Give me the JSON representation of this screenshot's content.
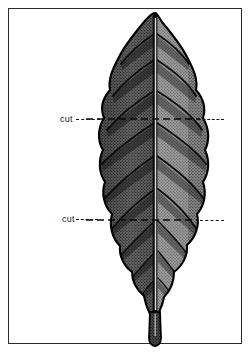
{
  "figure": {
    "style": "engraving",
    "frame": {
      "border_color": "#2b2b2b",
      "background": "#ffffff"
    }
  },
  "annotations": [
    {
      "id": "cut-upper",
      "label": "cut",
      "position": "upper",
      "leader": "dashed",
      "y": 119
    },
    {
      "id": "cut-lower",
      "label": "cut",
      "position": "lower",
      "leader": "dashed",
      "y": 220
    }
  ],
  "colors": {
    "ink": "#1a1a1a",
    "frame": "#2b2b2b",
    "leaf_dark": "#3a3a3a",
    "leaf_mid": "#6e6e6e",
    "leaf_light": "#9a9a9a",
    "paper": "#ffffff"
  },
  "leaf": {
    "apex": "acute",
    "margin": "sinuate",
    "venation": "pinnate",
    "midrib": true,
    "petiole": true,
    "lateral_vein_pairs": 9
  }
}
